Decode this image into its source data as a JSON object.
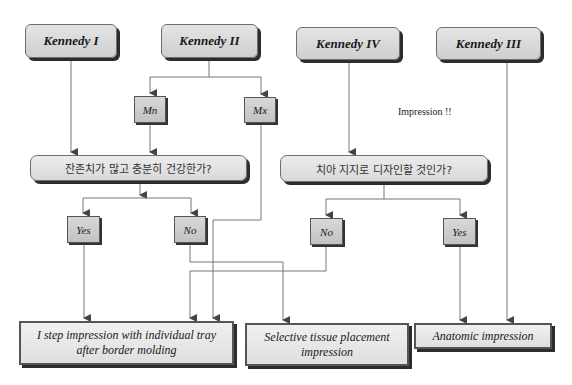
{
  "diagram": {
    "classes": [
      {
        "id": "k1",
        "label": "Kennedy I"
      },
      {
        "id": "k2",
        "label": "Kennedy II"
      },
      {
        "id": "k4",
        "label": "Kennedy IV"
      },
      {
        "id": "k3",
        "label": "Kennedy III"
      }
    ],
    "arches": [
      {
        "id": "mn",
        "label": "Mn"
      },
      {
        "id": "mx",
        "label": "Mx"
      }
    ],
    "questions": [
      {
        "id": "q1",
        "label": "잔존치가 많고 충분히 건강한가?"
      },
      {
        "id": "q2",
        "label": "치아 지지로 디자인할 것인가?"
      }
    ],
    "answers": [
      {
        "id": "q1_yes",
        "label": "Yes"
      },
      {
        "id": "q1_no",
        "label": "No"
      },
      {
        "id": "q2_no",
        "label": "No"
      },
      {
        "id": "q2_yes",
        "label": "Yes"
      }
    ],
    "outcomes": [
      {
        "id": "o1",
        "label": "I step impression with individual tray after border molding"
      },
      {
        "id": "o2",
        "label": "Selective tissue placement impression"
      },
      {
        "id": "o3",
        "label": "Anatomic impression"
      }
    ],
    "note": "Impression !!",
    "edges": [
      [
        "Kennedy I",
        "Q1"
      ],
      [
        "Kennedy II",
        "Mn"
      ],
      [
        "Kennedy II",
        "Mx"
      ],
      [
        "Mn",
        "Q1"
      ],
      [
        "Mx",
        "I step impression"
      ],
      [
        "Q1",
        "Yes"
      ],
      [
        "Q1",
        "No"
      ],
      [
        "Q1 Yes",
        "I step impression"
      ],
      [
        "Q1 No",
        "Selective tissue placement impression"
      ],
      [
        "Kennedy IV",
        "Q2"
      ],
      [
        "Q2",
        "No"
      ],
      [
        "Q2",
        "Yes"
      ],
      [
        "Q2 No",
        "I step impression"
      ],
      [
        "Q2 Yes",
        "Anatomic impression"
      ],
      [
        "Kennedy III",
        "Anatomic impression"
      ]
    ]
  }
}
